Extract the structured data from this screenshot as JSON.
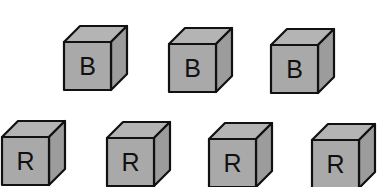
{
  "diagram": {
    "colors": {
      "face": "#a9a9a9",
      "top": "#b4b4b4",
      "side": "#9c9c9c",
      "stroke": "#111111",
      "background": "#ffffff"
    },
    "rows": [
      {
        "name": "top-row",
        "cubes": [
          {
            "label": "B",
            "x": 64,
            "y": 42
          },
          {
            "label": "B",
            "x": 169,
            "y": 44
          },
          {
            "label": "B",
            "x": 271,
            "y": 45
          }
        ]
      },
      {
        "name": "bottom-row",
        "cubes": [
          {
            "label": "R",
            "x": 2,
            "y": 137
          },
          {
            "label": "R",
            "x": 107,
            "y": 138
          },
          {
            "label": "R",
            "x": 209,
            "y": 139
          },
          {
            "label": "R",
            "x": 312,
            "y": 140
          }
        ]
      }
    ],
    "cube": {
      "w": 47,
      "h": 48,
      "dx": 16,
      "dy": 16
    }
  }
}
